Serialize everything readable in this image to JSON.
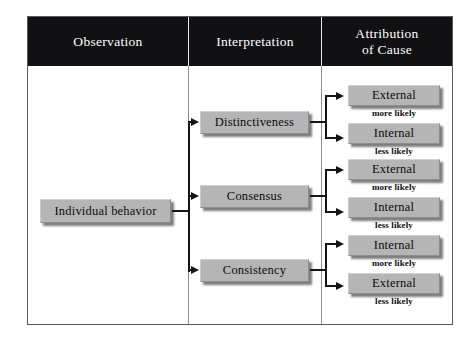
{
  "figure": {
    "headers": [
      {
        "lines": [
          "Observation"
        ]
      },
      {
        "lines": [
          "Interpretation"
        ]
      },
      {
        "lines": [
          "Attribution",
          "of Cause"
        ]
      }
    ],
    "observation": {
      "label": "Individual behavior"
    },
    "interpretations": [
      {
        "label": "Distinctiveness"
      },
      {
        "label": "Consensus"
      },
      {
        "label": "Consistency"
      }
    ],
    "attributions": [
      {
        "label": "External",
        "caption": "more likely"
      },
      {
        "label": "Internal",
        "caption": "less likely"
      },
      {
        "label": "External",
        "caption": "more likely"
      },
      {
        "label": "Internal",
        "caption": "less likely"
      },
      {
        "label": "Internal",
        "caption": "more likely"
      },
      {
        "label": "External",
        "caption": "less likely"
      }
    ],
    "colors": {
      "header_background": "#111012",
      "header_text": "#ffffff",
      "box_fill": "#b5b5b5",
      "box_text": "#0c0c0c",
      "connector": "#151515",
      "frame_border": "#5a5a5e",
      "page_background": "#ffffff"
    }
  }
}
